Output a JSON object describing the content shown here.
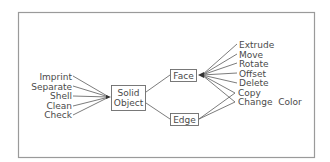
{
  "diagram": {
    "central_node": {
      "line1": "Solid",
      "line2": "Object"
    },
    "face_node": {
      "label": "Face"
    },
    "edge_node": {
      "label": "Edge"
    },
    "body_operations": [
      "Imprint",
      "Separate",
      "Shell",
      "Clean",
      "Check"
    ],
    "face_operations": [
      "Extrude",
      "Move",
      "Rotate",
      "Offset",
      "Delete",
      "Copy",
      "Change  Color"
    ],
    "edge_operations": [
      "Copy",
      "Change  Color"
    ],
    "colors": {
      "line": "#5a5a5a",
      "text": "#4a4a4a",
      "frame": "#9a9a9a"
    }
  }
}
